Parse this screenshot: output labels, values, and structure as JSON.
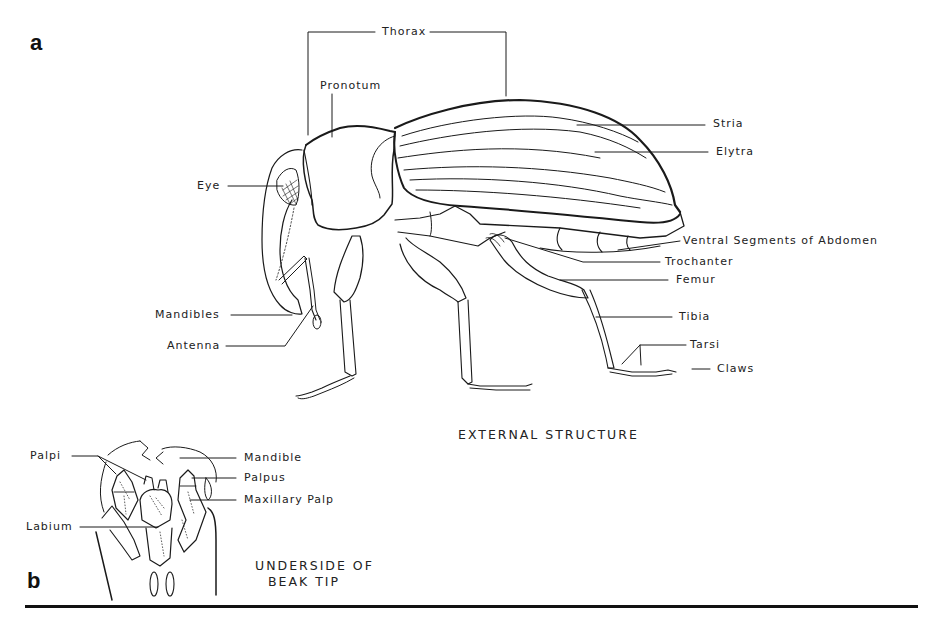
{
  "figure": {
    "panel_a": {
      "letter": "a",
      "caption": "EXTERNAL STRUCTURE",
      "labels": {
        "thorax": "Thorax",
        "pronotum": "Pronotum",
        "stria": "Stria",
        "elytra": "Elytra",
        "eye": "Eye",
        "ventral_segments": "Ventral Segments of Abdomen",
        "trochanter": "Trochanter",
        "femur": "Femur",
        "mandibles": "Mandibles",
        "tibia": "Tibia",
        "antenna": "Antenna",
        "tarsi": "Tarsi",
        "claws": "Claws"
      }
    },
    "panel_b": {
      "letter": "b",
      "caption_line1": "UNDERSIDE OF",
      "caption_line2": "BEAK TIP",
      "labels": {
        "palpi": "Palpi",
        "mandible": "Mandible",
        "palpus": "Palpus",
        "maxillary_palp": "Maxillary Palp",
        "labium": "Labium"
      }
    }
  },
  "colors": {
    "ink": "#1a1a1a",
    "background": "#ffffff"
  }
}
